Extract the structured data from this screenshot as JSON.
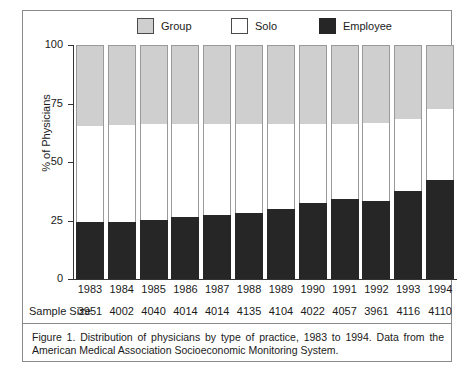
{
  "legend": {
    "items": [
      {
        "label": "Group",
        "key": "group",
        "color": "#cfcfcf"
      },
      {
        "label": "Solo",
        "key": "solo",
        "color": "#ffffff"
      },
      {
        "label": "Employee",
        "key": "employee",
        "color": "#262626"
      }
    ]
  },
  "axis": {
    "ylabel": "% of Physicians",
    "yticks": [
      "0",
      "25",
      "50",
      "75",
      "100"
    ]
  },
  "sample_size": {
    "title": "Sample Size",
    "values": [
      "3951",
      "4002",
      "4040",
      "4014",
      "4014",
      "4135",
      "4104",
      "4022",
      "4057",
      "3961",
      "4116",
      "4110"
    ]
  },
  "caption": "Figure 1.  Distribution of physicians by type of practice, 1983 to 1994. Data from the American Medical Association Socioeconomic Monitoring System.",
  "chart_data": {
    "type": "bar",
    "subtype": "stacked-percent",
    "title": "",
    "xlabel": "",
    "ylabel": "% of Physicians",
    "ylim": [
      0,
      100
    ],
    "yticks": [
      0,
      25,
      50,
      75,
      100
    ],
    "grid": false,
    "legend_position": "top",
    "categories": [
      "1983",
      "1984",
      "1985",
      "1986",
      "1987",
      "1988",
      "1989",
      "1990",
      "1991",
      "1992",
      "1993",
      "1994"
    ],
    "series": [
      {
        "name": "Employee",
        "color": "#262626",
        "values": [
          24.4,
          24.4,
          25.2,
          26.5,
          27.4,
          28.2,
          29.9,
          32.5,
          34.2,
          33.3,
          37.6,
          42.3
        ]
      },
      {
        "name": "Solo",
        "color": "#ffffff",
        "values": [
          41.0,
          41.6,
          41.0,
          39.7,
          38.9,
          38.0,
          36.3,
          33.8,
          32.1,
          33.3,
          30.8,
          30.3
        ]
      },
      {
        "name": "Group",
        "color": "#cfcfcf",
        "values": [
          34.6,
          34.0,
          33.8,
          33.8,
          33.7,
          33.8,
          33.8,
          33.7,
          33.7,
          33.4,
          31.6,
          27.4
        ]
      }
    ],
    "sample_size": [
      3951,
      4002,
      4040,
      4014,
      4014,
      4135,
      4104,
      4022,
      4057,
      3961,
      4116,
      4110
    ]
  }
}
